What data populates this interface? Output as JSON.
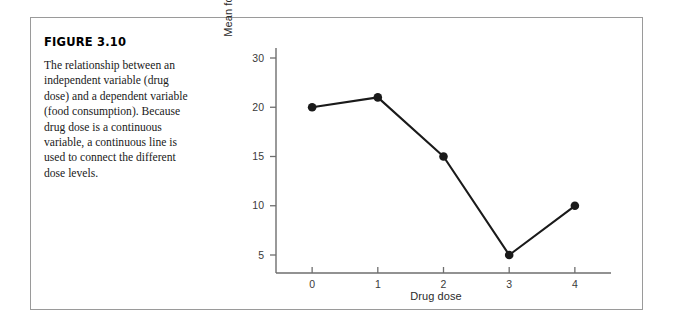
{
  "figure": {
    "title": "FIGURE 3.10",
    "caption": "The relationship between an independent variable (drug dose) and a dependent variable (food consumption). Because drug dose is a continuous variable, a continuous line is used to connect the different dose levels."
  },
  "chart_data": {
    "type": "line",
    "title": "",
    "xlabel": "Drug dose",
    "ylabel": "Mean food consumption",
    "x": [
      0,
      1,
      2,
      3,
      4
    ],
    "values": [
      20,
      22,
      15,
      5,
      10
    ],
    "series": [
      {
        "name": "Mean food consumption",
        "values": [
          20,
          22,
          15,
          5,
          10
        ]
      }
    ],
    "categories": [
      "0",
      "1",
      "2",
      "3",
      "4"
    ],
    "xtick_labels": [
      "0",
      "1",
      "2",
      "3",
      "4"
    ],
    "ytick_labels": [
      "30",
      "20",
      "15",
      "10",
      "5"
    ],
    "ytick_values": [
      30,
      20,
      15,
      10,
      5
    ],
    "xlim": [
      -0.55,
      4.55
    ],
    "ylim": [
      0,
      32
    ],
    "grid": false,
    "legend": false,
    "marker": "filled-circle",
    "line_color": "#1a1a1a",
    "marker_color": "#1a1a1a",
    "axis_color": "#6e6e6e"
  },
  "colors": {
    "frame_border": "#9a9a9a",
    "text": "#1a1a1a",
    "background": "#ffffff"
  }
}
